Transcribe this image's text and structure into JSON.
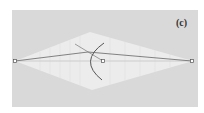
{
  "figure": {
    "panel_label": "(c)",
    "background_color": "#d9d9d9",
    "region_color": "#ececec",
    "line_color": "#666666",
    "arc_color": "#555555"
  },
  "points": [
    {
      "name": "left-point",
      "x": 15,
      "y": 61
    },
    {
      "name": "center-point",
      "x": 103,
      "y": 61
    },
    {
      "name": "right-point",
      "x": 192,
      "y": 61
    }
  ]
}
